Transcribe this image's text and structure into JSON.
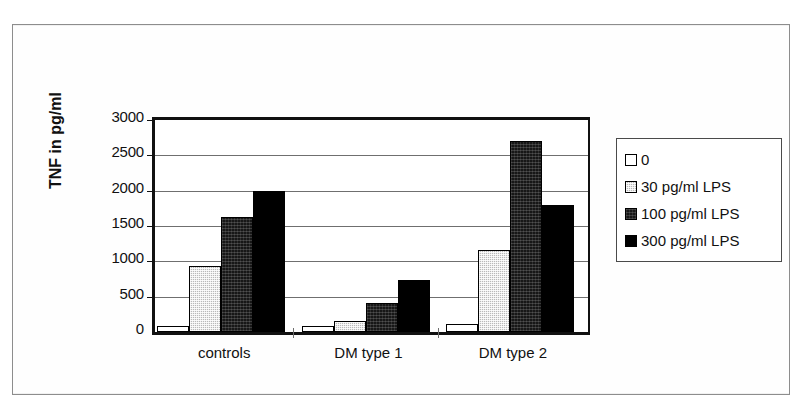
{
  "chart_data": {
    "type": "bar",
    "title": "",
    "xlabel": "",
    "ylabel": "TNF in pg/ml",
    "categories": [
      "controls",
      "DM type 1",
      "DM type 2"
    ],
    "series": [
      {
        "name": "0",
        "color": "#ffffff",
        "values": [
          80,
          90,
          120
        ]
      },
      {
        "name": "30 pg/ml LPS",
        "color": "#b9b9b9",
        "values": [
          930,
          150,
          1160
        ]
      },
      {
        "name": "100 pg/ml LPS",
        "color": "#171717",
        "values": [
          1630,
          410,
          2710
        ]
      },
      {
        "name": "300 pg/ml LPS",
        "color": "#000000",
        "values": [
          1990,
          730,
          1800
        ]
      }
    ],
    "ylim": [
      0,
      3000
    ],
    "yticks": [
      0,
      500,
      1000,
      1500,
      2000,
      2500,
      3000
    ],
    "ytick_labels": [
      "0",
      "500",
      "1000",
      "1500",
      "2000",
      "2500",
      "3000"
    ],
    "grid": true,
    "legend_position": "right"
  },
  "legend": {
    "items": [
      {
        "label": "0",
        "swatch": "white-swatch"
      },
      {
        "label": "30 pg/ml LPS",
        "swatch": "gray-swatch"
      },
      {
        "label": "100 pg/ml LPS",
        "swatch": "dark-swatch"
      },
      {
        "label": "300 pg/ml LPS",
        "swatch": "black-swatch"
      }
    ]
  },
  "axis": {
    "y_title": "TNF in pg/ml"
  }
}
